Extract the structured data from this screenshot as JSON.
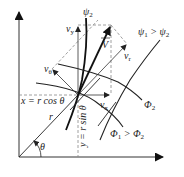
{
  "diagram": {
    "axes": {
      "x_label": "x",
      "y_label": "y",
      "origin": [
        19,
        157
      ],
      "x_end": [
        164,
        157
      ],
      "y_end": [
        19,
        10
      ]
    },
    "point_P": [
      78,
      95
    ],
    "labels": {
      "psi2": "ψ",
      "psi2_sub": "2",
      "psi_relation_a": "ψ",
      "psi_relation_a_sub": "1",
      "psi_relation_op": " > ",
      "psi_relation_b": "ψ",
      "psi_relation_b_sub": "2",
      "phi2": "Φ",
      "phi2_sub": "2",
      "phi_relation_a": "Φ",
      "phi_relation_a_sub": "1",
      "phi_relation_op": " > ",
      "phi_relation_b": "Φ",
      "phi_relation_b_sub": "2",
      "V": "V",
      "v_y": "v",
      "v_y_sub": "y",
      "v_x": "v",
      "v_x_sub": "x",
      "v_r": "v",
      "v_r_sub": "r",
      "v_theta": "v",
      "v_theta_sub": "θ",
      "r": "r",
      "theta": "θ",
      "x_eq": "x = r cos θ",
      "y_eq": "y = r sin θ"
    },
    "vectors": {
      "V": {
        "from": [
          78,
          95
        ],
        "to": [
          111,
          25
        ]
      },
      "v_y": {
        "from": [
          78,
          95
        ],
        "to": [
          78,
          25
        ]
      },
      "v_x": {
        "from": [
          78,
          95
        ],
        "to": [
          111,
          95
        ]
      },
      "v_r": {
        "from": [
          78,
          95
        ],
        "to": [
          127,
          44
        ]
      },
      "v_theta": {
        "from": [
          78,
          95
        ],
        "to": [
          52,
          69
        ]
      }
    },
    "colors": {
      "line": "#222222",
      "dashed": "#888888",
      "background": "#ffffff"
    }
  }
}
